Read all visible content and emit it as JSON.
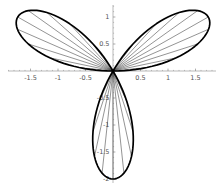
{
  "chart_data": {
    "type": "line",
    "title": "",
    "curve_equation": "r = 2 sin(3 theta)",
    "curve_kind": "polar-rose",
    "amplitude": 2,
    "frequency": 3,
    "petal_count": 3,
    "petal_base_angles_deg": [
      0,
      120,
      240
    ],
    "petal_tip_angles_deg": [
      30,
      150,
      270
    ],
    "petal_length": 2,
    "petal_tip_points_xy": [
      [
        1.732,
        1.0
      ],
      [
        -1.732,
        1.0
      ],
      [
        0.0,
        -2.0
      ]
    ],
    "radial_line_step_deg": 6,
    "radial_lines_per_petal": 9,
    "x_tick_values": [
      -1.5,
      -1,
      -0.5,
      0.5,
      1,
      1.5
    ],
    "x_tick_labels": [
      "-1.5",
      "-1",
      "-0.5",
      "0.5",
      "1",
      "1.5"
    ],
    "y_tick_values": [
      1,
      0.5,
      -0.5,
      -1,
      -1.5,
      -2
    ],
    "y_tick_labels": [
      "1",
      "0.5",
      "-0.5",
      "-1",
      "-1.5",
      "-2"
    ],
    "minor_tick_step": 0.1,
    "xlim": [
      -1.91,
      1.87
    ],
    "ylim": [
      -2.07,
      1.22
    ],
    "grid": false,
    "legend": null,
    "colors": {
      "curve": "#000000",
      "radial_lines": "#3a3a3a",
      "axes": "#9c9c9c",
      "ticks": "#8a8a8a",
      "tick_labels": "#555555",
      "background": "#ffffff"
    },
    "layout": {
      "size_px": [
        219,
        187
      ],
      "origin_px": [
        113,
        71
      ],
      "px_per_unit": [
        55,
        54
      ],
      "x_axis_px": [
        8,
        216
      ],
      "y_axis_px": [
        5,
        183
      ]
    }
  }
}
